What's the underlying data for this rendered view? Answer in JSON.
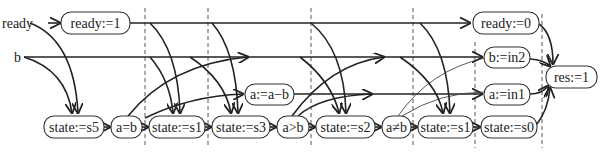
{
  "diagram": {
    "type": "dataflow-schedule",
    "inputs": [
      {
        "id": "ready",
        "label": "ready"
      },
      {
        "id": "b",
        "label": "b"
      }
    ],
    "nodes": [
      {
        "id": "n_ready1",
        "label": "ready:=1"
      },
      {
        "id": "n_readyzero",
        "label": "ready:=0"
      },
      {
        "id": "n_bin2",
        "label": "b:=in2"
      },
      {
        "id": "n_aminusb",
        "label": "a:=a−b"
      },
      {
        "id": "n_ain1",
        "label": "a:=in1"
      },
      {
        "id": "n_res1",
        "label": "res:=1"
      },
      {
        "id": "n_s5",
        "label": "state:=s5"
      },
      {
        "id": "n_aeqb",
        "label": "a=b"
      },
      {
        "id": "n_s1a",
        "label": "state:=s1"
      },
      {
        "id": "n_s3",
        "label": "state:=s3"
      },
      {
        "id": "n_agtb",
        "label": "a>b"
      },
      {
        "id": "n_s2",
        "label": "state:=s2"
      },
      {
        "id": "n_aneqb",
        "label": "a≠b"
      },
      {
        "id": "n_s1b",
        "label": "state:=s1"
      },
      {
        "id": "n_s0",
        "label": "state:=s0"
      }
    ],
    "stage_separators": 6
  }
}
